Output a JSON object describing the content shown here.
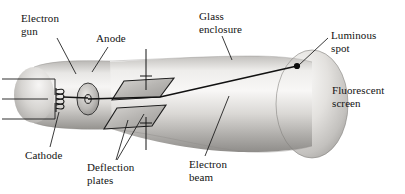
{
  "figure": {
    "background_color": "#ffffff",
    "ink_color": "#121212",
    "glass_light": "#f2f1ef",
    "glass_mid": "#c9c7c4",
    "glass_dark": "#8e8c89"
  },
  "labels": {
    "electron_gun": "Electron\ngun",
    "anode": "Anode",
    "glass_enclosure": "Glass\nenclosure",
    "luminous_spot": "Luminous\nspot",
    "fluorescent_screen": "Fluorescent\nscreen",
    "cathode": "Cathode",
    "deflection_plates": "Deflection\nplates",
    "electron_beam": "Electron\nbeam"
  },
  "parts": {
    "neck": "tube-neck",
    "flare": "tube-flare",
    "screen_face": "fluorescent-screen-face",
    "cathode_filament": "cathode-filament-coil",
    "anode_disc": "anode-disc",
    "upper_plate": "upper-deflection-plate",
    "lower_plate": "lower-deflection-plate",
    "beam_line": "electron-beam-line",
    "spot": "luminous-spot-dot",
    "lead_wires": "cathode-lead-wires"
  },
  "leader_lines": [
    {
      "name": "leader-electron-gun",
      "from": [
        57,
        38
      ],
      "to": [
        76,
        74
      ]
    },
    {
      "name": "leader-anode",
      "from": [
        108,
        47
      ],
      "to": [
        92,
        72
      ]
    },
    {
      "name": "leader-glass-enclosure",
      "from": [
        222,
        36
      ],
      "to": [
        232,
        60
      ]
    },
    {
      "name": "leader-luminous-spot",
      "from": [
        328,
        38
      ],
      "to": [
        297,
        66
      ]
    },
    {
      "name": "leader-cathode",
      "from": [
        50,
        147
      ],
      "to": [
        59,
        112
      ]
    },
    {
      "name": "leader-deflection-a",
      "from": [
        116,
        160
      ],
      "to": [
        128,
        119
      ]
    },
    {
      "name": "leader-deflection-b",
      "from": [
        117,
        160
      ],
      "to": [
        143,
        113
      ]
    },
    {
      "name": "leader-electron-beam",
      "from": [
        205,
        156
      ],
      "to": [
        228,
        96
      ]
    }
  ]
}
